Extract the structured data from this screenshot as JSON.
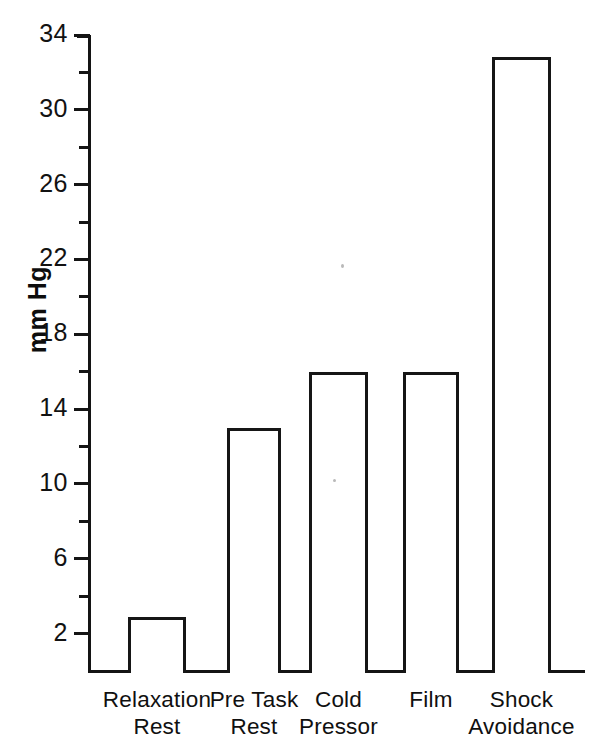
{
  "chart_data": {
    "type": "bar",
    "title": "",
    "xlabel": "",
    "ylabel": "mm Hg",
    "ylim": [
      0,
      34
    ],
    "grid": false,
    "legend": false,
    "categories": [
      "Relaxation Rest",
      "Pre Task Rest",
      "Cold Pressor",
      "Film",
      "Shock Avoidance"
    ],
    "category_lines": [
      [
        "Relaxation",
        "Rest"
      ],
      [
        "Pre Task",
        "Rest"
      ],
      [
        "Cold",
        "Pressor"
      ],
      [
        "Film",
        ""
      ],
      [
        "Shock",
        "Avoidance"
      ]
    ],
    "values": [
      2.9,
      13.0,
      16.0,
      16.0,
      32.8
    ],
    "y_ticks_major": [
      2,
      6,
      10,
      14,
      18,
      22,
      26,
      30,
      34
    ],
    "y_tick_labels": [
      "2",
      "6",
      "10",
      "14",
      "18",
      "22",
      "26",
      "30",
      "34"
    ],
    "y_ticks_minor": [
      4,
      8,
      12,
      16,
      20,
      24,
      28,
      32
    ],
    "bar_style": {
      "fill": "#ffffff",
      "edge_color": "#161616",
      "edge_width_px": 3
    },
    "colors": {
      "background": "#ffffff",
      "ink": "#141414"
    }
  },
  "axis": {
    "y_title": "mm Hg"
  }
}
